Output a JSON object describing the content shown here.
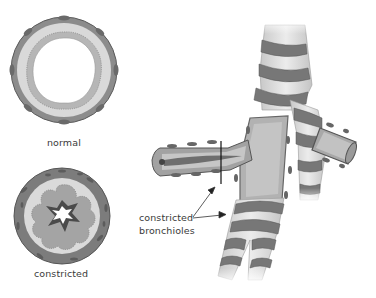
{
  "figure": {
    "cross_sections": [
      {
        "id": "normal",
        "label": "normal"
      },
      {
        "id": "constricted",
        "label": "constricted"
      }
    ],
    "annotation": {
      "line1": "constricted",
      "line2": "bronchioles"
    }
  },
  "colors": {
    "muscle_dark": "#6e6e6e",
    "muscle_mid": "#8a8a8a",
    "wall_light": "#d6d6d6",
    "mucosa": "#a8a8a8",
    "lumen": "#ffffff",
    "airway_fill": "#b4b4b4",
    "text": "#3a3a3a"
  }
}
